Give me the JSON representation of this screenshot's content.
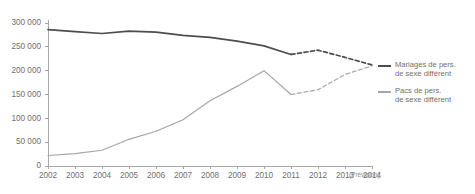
{
  "chart_data": {
    "type": "line",
    "title": "",
    "subtitle": "",
    "xlabel": "",
    "ylabel": "",
    "x": [
      2002,
      2003,
      2004,
      2005,
      2006,
      2007,
      2008,
      2009,
      2010,
      2011,
      2012,
      2013,
      2014
    ],
    "xtick_labels": [
      "2002",
      "2003",
      "2004",
      "2005",
      "2006",
      "2007",
      "2008",
      "2009",
      "2010",
      "2011",
      "2012",
      "2013",
      "2014"
    ],
    "ytick_labels": [
      "0",
      "50 000",
      "100 000",
      "150 000",
      "200 000",
      "250 000",
      "300 000"
    ],
    "ytick_values": [
      0,
      50000,
      100000,
      150000,
      200000,
      250000,
      300000
    ],
    "ylim": [
      0,
      310000
    ],
    "xlim": [
      2002,
      2014
    ],
    "grid": false,
    "legend_position": "right",
    "annotations": [
      {
        "text": "(Prévision)",
        "position": "x-axis-right"
      }
    ],
    "forecast_starts_at": 2012,
    "series": [
      {
        "name": "Mariages de pers. de sexe différent",
        "color": "#4d4d4d",
        "values": [
          286000,
          282000,
          278000,
          283000,
          281000,
          274000,
          270000,
          262000,
          252000,
          234000,
          243000,
          228000,
          212000
        ],
        "solid_through": 2011,
        "dashed_from": 2011
      },
      {
        "name": "Pacs de pers. de sexe différent",
        "color": "#a6a6a6",
        "values": [
          22000,
          26000,
          33000,
          56000,
          73000,
          97000,
          137000,
          167000,
          200000,
          150000,
          160000,
          192000,
          210000
        ],
        "solid_through": 2011,
        "dashed_from": 2011
      }
    ]
  },
  "legend": {
    "entries": [
      {
        "swatch_name": "legend-swatch-mariages",
        "line1": "Mariages de pers.",
        "line2": "de sexe différent"
      },
      {
        "swatch_name": "legend-swatch-pacs",
        "line1": "Pacs de pers.",
        "line2": "de sexe différent"
      }
    ]
  },
  "axes": {
    "forecast_note": "(Prévision)"
  },
  "colors": {
    "mariages": "#4d4d4d",
    "pacs": "#a6a6a6",
    "axis": "#a8a8a8",
    "text": "#6f6f6f",
    "background": "#ffffff"
  }
}
